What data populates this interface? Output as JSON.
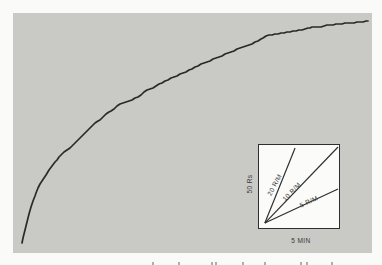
{
  "figure": {
    "page_background": "#fafaf8",
    "panel_background": "#c9c9c6",
    "ink_color": "#2a2a2a"
  },
  "chart_data": {
    "type": "line",
    "title": "",
    "xlabel": "",
    "ylabel": "",
    "grid": false,
    "main_axes_visible": false,
    "series": [
      {
        "name": "cumulative response record",
        "color": "#2a2a2a",
        "points_px": [
          [
            22,
            243
          ],
          [
            23,
            238
          ],
          [
            25,
            230
          ],
          [
            27,
            222
          ],
          [
            29,
            214
          ],
          [
            31,
            207
          ],
          [
            33,
            201
          ],
          [
            35,
            196
          ],
          [
            36,
            193
          ],
          [
            38,
            188
          ],
          [
            40,
            184
          ],
          [
            42,
            181
          ],
          [
            44,
            178
          ],
          [
            46,
            175
          ],
          [
            49,
            170
          ],
          [
            52,
            166
          ],
          [
            55,
            162
          ],
          [
            57,
            160
          ],
          [
            59,
            157
          ],
          [
            61,
            155
          ],
          [
            64,
            152
          ],
          [
            67,
            150
          ],
          [
            70,
            148
          ],
          [
            72,
            146
          ],
          [
            75,
            143
          ],
          [
            78,
            140
          ],
          [
            80,
            138
          ],
          [
            83,
            135
          ],
          [
            86,
            132
          ],
          [
            89,
            129
          ],
          [
            92,
            126
          ],
          [
            95,
            123
          ],
          [
            98,
            121
          ],
          [
            100,
            120
          ],
          [
            103,
            117
          ],
          [
            106,
            114
          ],
          [
            109,
            112
          ],
          [
            111,
            111
          ],
          [
            114,
            109
          ],
          [
            117,
            106
          ],
          [
            120,
            104
          ],
          [
            123,
            103
          ],
          [
            126,
            102
          ],
          [
            129,
            101
          ],
          [
            132,
            100
          ],
          [
            135,
            98
          ],
          [
            138,
            97
          ],
          [
            141,
            95
          ],
          [
            144,
            92
          ],
          [
            147,
            90
          ],
          [
            150,
            89
          ],
          [
            153,
            88
          ],
          [
            156,
            86
          ],
          [
            159,
            84
          ],
          [
            162,
            83
          ],
          [
            165,
            81
          ],
          [
            168,
            80
          ],
          [
            171,
            78
          ],
          [
            174,
            77
          ],
          [
            177,
            76
          ],
          [
            180,
            74
          ],
          [
            183,
            73
          ],
          [
            186,
            72
          ],
          [
            189,
            70
          ],
          [
            192,
            69
          ],
          [
            195,
            67
          ],
          [
            198,
            66
          ],
          [
            201,
            64
          ],
          [
            204,
            63
          ],
          [
            207,
            62
          ],
          [
            210,
            61
          ],
          [
            213,
            59
          ],
          [
            216,
            58
          ],
          [
            219,
            57
          ],
          [
            222,
            56
          ],
          [
            225,
            54
          ],
          [
            228,
            53
          ],
          [
            231,
            52
          ],
          [
            234,
            51
          ],
          [
            237,
            49
          ],
          [
            240,
            48
          ],
          [
            243,
            47
          ],
          [
            246,
            46
          ],
          [
            249,
            45
          ],
          [
            252,
            44
          ],
          [
            255,
            42
          ],
          [
            258,
            41
          ],
          [
            261,
            39
          ],
          [
            263,
            38
          ],
          [
            266,
            36
          ],
          [
            269,
            35
          ],
          [
            272,
            35
          ],
          [
            275,
            34
          ],
          [
            278,
            34
          ],
          [
            281,
            33
          ],
          [
            284,
            33
          ],
          [
            287,
            32
          ],
          [
            290,
            32
          ],
          [
            293,
            31
          ],
          [
            296,
            31
          ],
          [
            299,
            30
          ],
          [
            302,
            30
          ],
          [
            305,
            29
          ],
          [
            308,
            28
          ],
          [
            310,
            28
          ],
          [
            312,
            27
          ],
          [
            315,
            27
          ],
          [
            318,
            27
          ],
          [
            321,
            27
          ],
          [
            324,
            26
          ],
          [
            327,
            25
          ],
          [
            330,
            25
          ],
          [
            333,
            25
          ],
          [
            336,
            24
          ],
          [
            339,
            24
          ],
          [
            342,
            24
          ],
          [
            345,
            23
          ],
          [
            348,
            23
          ],
          [
            351,
            23
          ],
          [
            354,
            23
          ],
          [
            357,
            22
          ],
          [
            360,
            22
          ],
          [
            363,
            22
          ],
          [
            366,
            21
          ],
          [
            368,
            21
          ]
        ]
      }
    ],
    "inset_legend": {
      "position": "bottom-right",
      "background": "#fbfbf9",
      "border_color": "#2e2e2e",
      "y_scale_label": "50 Rs",
      "x_scale_label": "5 MIN",
      "slope_guides": [
        {
          "label": "20 R/M",
          "line_px": [
            6,
            80,
            37,
            3
          ]
        },
        {
          "label": "10 R/M",
          "line_px": [
            6,
            80,
            81,
            2
          ]
        },
        {
          "label": "5 R/M",
          "line_px": [
            6,
            80,
            81,
            45
          ]
        }
      ]
    },
    "caption_fragments_x": [
      152,
      178,
      211,
      215,
      242,
      264,
      300,
      306,
      331
    ]
  }
}
